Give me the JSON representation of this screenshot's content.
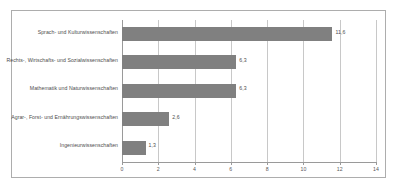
{
  "chart_data": {
    "type": "bar",
    "orientation": "horizontal",
    "title": "",
    "subtitle": "",
    "xlabel": "",
    "ylabel": "",
    "xlim": [
      0,
      14
    ],
    "xticks": [
      "0",
      "2",
      "4",
      "6",
      "8",
      "10",
      "12",
      "14"
    ],
    "grid": "vertical",
    "legend": "none",
    "bar_color": "#808080",
    "gridline_color": "#c8c8c8",
    "frame_color": "#adadad",
    "text_color": "#4d4d4d",
    "decimal_separator": ",",
    "categories": [
      "Sprach- und Kulturwissenschaften",
      "Rechts-, Wirtschafts- und Sozialwissenschaften",
      "Mathematik und Naturwissenschaften",
      "Agrar-, Forst- und Ernährungswissenschaften",
      "Ingenieurwissenschaften"
    ],
    "values": [
      11.6,
      6.3,
      6.3,
      2.6,
      1.3
    ],
    "value_labels": [
      "11,6",
      "6,3",
      "6,3",
      "2,6",
      "1,3"
    ]
  }
}
